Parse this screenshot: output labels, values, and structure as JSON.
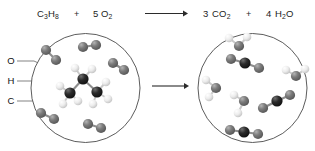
{
  "figure": {
    "title_equation": "C3H8 + 5 O2 -> 3 CO2 + 4 H2O"
  },
  "equation": {
    "reactant1": {
      "coefficient": "",
      "formula_parts": [
        {
          "text": "C",
          "sub": false
        },
        {
          "text": "3",
          "sub": true
        },
        {
          "text": "H",
          "sub": false
        },
        {
          "text": "8",
          "sub": true
        }
      ],
      "plain": "C3H8"
    },
    "plus1": "+",
    "reactant2": {
      "coefficient": "5",
      "formula_parts": [
        {
          "text": "O",
          "sub": false
        },
        {
          "text": "2",
          "sub": true
        }
      ],
      "plain": "5 O2"
    },
    "arrow_label": "yields",
    "product1": {
      "coefficient": "3",
      "formula_parts": [
        {
          "text": "CO",
          "sub": false
        },
        {
          "text": "2",
          "sub": true
        }
      ],
      "plain": "3 CO2"
    },
    "plus2": "+",
    "product2": {
      "coefficient": "4",
      "formula_parts": [
        {
          "text": "H",
          "sub": false
        },
        {
          "text": "2",
          "sub": true
        },
        {
          "text": "O",
          "sub": false
        }
      ],
      "plain": "4 H2O"
    }
  },
  "legend": {
    "items": [
      {
        "label": "O",
        "name": "oxygen",
        "color": "#6a6a6a"
      },
      {
        "label": "H",
        "name": "hydrogen",
        "color": "#ededed"
      },
      {
        "label": "C",
        "name": "carbon",
        "color": "#1b1b1b"
      }
    ]
  },
  "colors": {
    "oxygen": "#6a6a6a",
    "oxygen_highlight": "#a8a8a8",
    "hydrogen": "#ededed",
    "hydrogen_highlight": "#ffffff",
    "carbon": "#1b1b1b",
    "carbon_highlight": "#6d6d6d",
    "vessel_stroke": "#4a4a4a",
    "bond": "#8d8d8d",
    "text": "#1c1c1c"
  },
  "vessels": {
    "left": {
      "name": "reactants-vessel",
      "cx": 85.5,
      "cy": 88,
      "r": 54.5,
      "contents_summary": "1 propane molecule and 5 oxygen molecules",
      "molecules": {
        "propane": {
          "carbons": [
            {
              "x": 83,
              "y": 79
            },
            {
              "x": 70,
              "y": 93
            },
            {
              "x": 97,
              "y": 92
            }
          ],
          "hydrogens": [
            {
              "x": 75,
              "y": 68,
              "bond_to": 0
            },
            {
              "x": 92,
              "y": 69,
              "bond_to": 0
            },
            {
              "x": 60,
              "y": 86,
              "bond_to": 1
            },
            {
              "x": 63,
              "y": 104,
              "bond_to": 1
            },
            {
              "x": 78,
              "y": 101,
              "bond_to": 1
            },
            {
              "x": 106,
              "y": 82,
              "bond_to": 2
            },
            {
              "x": 108,
              "y": 99,
              "bond_to": 2
            },
            {
              "x": 93,
              "y": 104,
              "bond_to": 2
            }
          ]
        },
        "oxygen_molecules": [
          {
            "a": {
              "x": 46,
              "y": 50
            },
            "b": {
              "x": 56,
              "y": 60
            }
          },
          {
            "a": {
              "x": 83,
              "y": 47
            },
            "b": {
              "x": 96,
              "y": 45
            }
          },
          {
            "a": {
              "x": 113,
              "y": 63
            },
            "b": {
              "x": 124,
              "y": 70
            }
          },
          {
            "a": {
              "x": 41,
              "y": 113
            },
            "b": {
              "x": 54,
              "y": 119
            }
          },
          {
            "a": {
              "x": 88,
              "y": 124
            },
            "b": {
              "x": 101,
              "y": 128
            }
          }
        ]
      }
    },
    "right": {
      "name": "products-vessel",
      "cx": 252.5,
      "cy": 88,
      "r": 54.5,
      "contents_summary": "3 carbon dioxide molecules and 4 water molecules",
      "molecules": {
        "carbon_dioxide": [
          {
            "c": {
              "x": 245,
              "y": 63
            },
            "o1": {
              "x": 231,
              "y": 59
            },
            "o2": {
              "x": 259,
              "y": 68
            }
          },
          {
            "c": {
              "x": 277,
              "y": 101
            },
            "o1": {
              "x": 290,
              "y": 95
            },
            "o2": {
              "x": 263,
              "y": 108
            }
          },
          {
            "c": {
              "x": 244,
              "y": 132
            },
            "o1": {
              "x": 230,
              "y": 130
            },
            "o2": {
              "x": 258,
              "y": 134
            }
          }
        ],
        "water": [
          {
            "o": {
              "x": 239,
              "y": 46
            },
            "h1": {
              "x": 229,
              "y": 38
            },
            "h2": {
              "x": 247,
              "y": 37
            }
          },
          {
            "o": {
              "x": 216,
              "y": 88
            },
            "h1": {
              "x": 206,
              "y": 80
            },
            "h2": {
              "x": 209,
              "y": 97
            }
          },
          {
            "o": {
              "x": 296,
              "y": 76
            },
            "h1": {
              "x": 305,
              "y": 69
            },
            "h2": {
              "x": 286,
              "y": 70
            }
          },
          {
            "o": {
              "x": 244,
              "y": 101
            },
            "h1": {
              "x": 234,
              "y": 95
            },
            "h2": {
              "x": 238,
              "y": 113
            }
          }
        ]
      }
    }
  },
  "arrows": {
    "equation_arrow": {
      "x1": 145,
      "y1": 13.5,
      "x2": 186,
      "y2": 13.5
    },
    "vessel_arrow": {
      "x1": 152,
      "y1": 86,
      "x2": 187,
      "y2": 86
    }
  }
}
